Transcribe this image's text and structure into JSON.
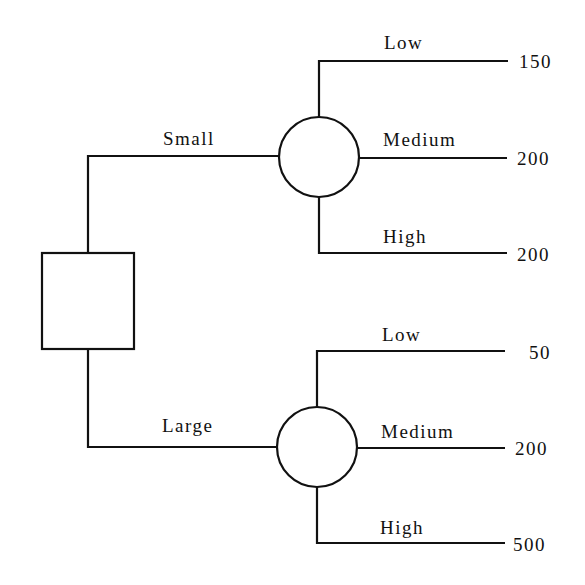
{
  "diagram": {
    "type": "decision-tree",
    "decision_node": {
      "shape": "square"
    },
    "branches": [
      {
        "label": "Small",
        "chance_node": {
          "shape": "circle"
        },
        "outcomes": [
          {
            "label": "Low",
            "value": "150"
          },
          {
            "label": "Medium",
            "value": "200"
          },
          {
            "label": "High",
            "value": "200"
          }
        ]
      },
      {
        "label": "Large",
        "chance_node": {
          "shape": "circle"
        },
        "outcomes": [
          {
            "label": "Low",
            "value": "50"
          },
          {
            "label": "Medium",
            "value": "200"
          },
          {
            "label": "High",
            "value": "500"
          }
        ]
      }
    ],
    "colors": {
      "line": "#111111",
      "background": "#ffffff"
    }
  }
}
